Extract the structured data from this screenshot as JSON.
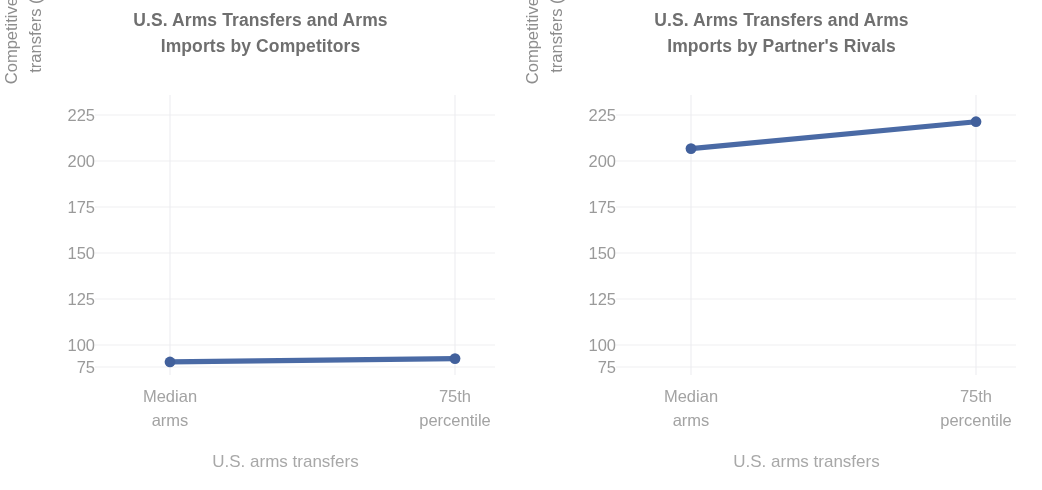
{
  "figure": {
    "background_color": "#ffffff",
    "line_color": "#4a6aa5",
    "grid_color": "#f0eff2",
    "title_color": "#6f6f6f",
    "tick_color": "#9a9a9a"
  },
  "panels": [
    {
      "title_line1": "U.S. Arms Transfers and Arms",
      "title_line2": "Imports by Competitors",
      "ylabel_line1": "Competitive arms",
      "ylabel_line2": "transfers (TIV)",
      "xlabel": "U.S. arms transfers",
      "yticks": [
        "225",
        "200",
        "175",
        "150",
        "125",
        "100",
        "75"
      ],
      "xticks": [
        {
          "line1": "Median",
          "line2": "arms"
        },
        {
          "line1": "75th",
          "line2": "percentile"
        }
      ]
    },
    {
      "title_line1": "U.S. Arms Transfers and Arms",
      "title_line2": "Imports by Partner's Rivals",
      "ylabel_line1": "Competitive arms",
      "ylabel_line2": "transfers (TIV)",
      "xlabel": "U.S. arms transfers",
      "yticks": [
        "225",
        "200",
        "175",
        "150",
        "125",
        "100",
        "75"
      ],
      "xticks": [
        {
          "line1": "Median",
          "line2": "arms"
        },
        {
          "line1": "75th",
          "line2": "percentile"
        }
      ]
    }
  ],
  "chart_data": [
    {
      "type": "line",
      "title": "U.S. Arms Transfers and Arms Imports by Competitors",
      "xlabel": "U.S. arms transfers",
      "ylabel": "Competitive arms transfers (TIV)",
      "categories": [
        "Median arms",
        "75th percentile"
      ],
      "values": [
        78,
        80
      ],
      "ylim": [
        75,
        225
      ],
      "yticks": [
        75,
        100,
        125,
        150,
        175,
        200,
        225
      ],
      "grid": true,
      "legend": "none",
      "marker": "circle",
      "color": "#4a6aa5"
    },
    {
      "type": "line",
      "title": "U.S. Arms Transfers and Arms Imports by Partner's Rivals",
      "xlabel": "U.S. arms transfers",
      "ylabel": "Competitive arms transfers (TIV)",
      "categories": [
        "Median arms",
        "75th percentile"
      ],
      "values": [
        205,
        221
      ],
      "ylim": [
        75,
        225
      ],
      "yticks": [
        75,
        100,
        125,
        150,
        175,
        200,
        225
      ],
      "grid": true,
      "legend": "none",
      "marker": "circle",
      "color": "#4a6aa5"
    }
  ]
}
